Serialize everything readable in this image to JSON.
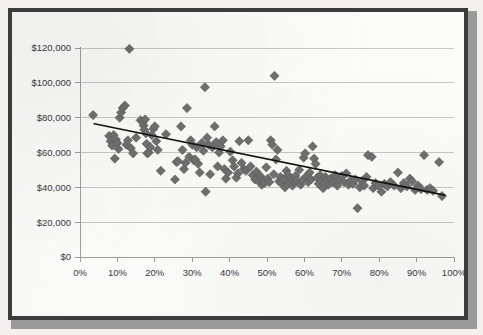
{
  "figure": {
    "frame_color": "#3c3c3c",
    "plot_background": "#fbfbfa",
    "marker_color": "#6f6f6f",
    "gridline_color": "#c6c6c6",
    "trendline_color": "#141414"
  },
  "chart_data": {
    "type": "scatter",
    "title": "",
    "subtitle": "",
    "xlabel": "",
    "ylabel": "",
    "xlim": [
      0,
      100
    ],
    "ylim": [
      0,
      120000
    ],
    "grid": true,
    "legend": "none",
    "x_tick_labels": [
      "0%",
      "10%",
      "20%",
      "30%",
      "40%",
      "50%",
      "60%",
      "70%",
      "80%",
      "90%",
      "100%"
    ],
    "x_tick_values": [
      0,
      10,
      20,
      30,
      40,
      50,
      60,
      70,
      80,
      90,
      100
    ],
    "y_tick_labels": [
      "$0",
      "$20,000",
      "$40,000",
      "$60,000",
      "$80,000",
      "$100,000",
      "$120,000"
    ],
    "y_tick_values": [
      0,
      20000,
      40000,
      60000,
      80000,
      100000,
      120000
    ],
    "series": [
      {
        "name": "observations",
        "marker": "diamond",
        "color": "#6f6f6f",
        "points": [
          [
            3.5,
            81500
          ],
          [
            7.8,
            69500
          ],
          [
            8.2,
            66500
          ],
          [
            8.6,
            64000
          ],
          [
            9.0,
            70000
          ],
          [
            9.3,
            56500
          ],
          [
            9.6,
            67500
          ],
          [
            10.0,
            65500
          ],
          [
            10.3,
            62000
          ],
          [
            10.6,
            80000
          ],
          [
            11.0,
            83000
          ],
          [
            11.4,
            85500
          ],
          [
            12.0,
            87000
          ],
          [
            12.4,
            64500
          ],
          [
            12.8,
            67000
          ],
          [
            13.2,
            119500
          ],
          [
            13.6,
            62500
          ],
          [
            14.2,
            59500
          ],
          [
            15.0,
            68500
          ],
          [
            16.2,
            78500
          ],
          [
            16.8,
            77500
          ],
          [
            17.0,
            75500
          ],
          [
            17.2,
            73000
          ],
          [
            17.4,
            79000
          ],
          [
            17.6,
            71000
          ],
          [
            17.8,
            65000
          ],
          [
            18.0,
            59500
          ],
          [
            18.4,
            60000
          ],
          [
            18.8,
            63000
          ],
          [
            19.2,
            70000
          ],
          [
            19.6,
            73500
          ],
          [
            20.0,
            75000
          ],
          [
            20.4,
            66500
          ],
          [
            20.8,
            61500
          ],
          [
            21.6,
            49500
          ],
          [
            23.0,
            70500
          ],
          [
            25.4,
            44500
          ],
          [
            25.8,
            54500
          ],
          [
            26.2,
            55000
          ],
          [
            27.0,
            75000
          ],
          [
            27.4,
            61500
          ],
          [
            27.8,
            50500
          ],
          [
            28.2,
            54000
          ],
          [
            28.6,
            85500
          ],
          [
            29.2,
            57500
          ],
          [
            29.6,
            67000
          ],
          [
            30.0,
            64500
          ],
          [
            30.4,
            55500
          ],
          [
            30.8,
            56000
          ],
          [
            31.2,
            63000
          ],
          [
            31.6,
            53500
          ],
          [
            32.0,
            48500
          ],
          [
            32.6,
            65500
          ],
          [
            33.0,
            61000
          ],
          [
            33.4,
            97500
          ],
          [
            33.6,
            37500
          ],
          [
            34.0,
            68500
          ],
          [
            34.4,
            64500
          ],
          [
            34.8,
            47500
          ],
          [
            35.4,
            63000
          ],
          [
            36.0,
            75000
          ],
          [
            36.4,
            66000
          ],
          [
            36.8,
            52000
          ],
          [
            37.2,
            60000
          ],
          [
            37.6,
            63500
          ],
          [
            38.2,
            67000
          ],
          [
            38.6,
            50500
          ],
          [
            39.0,
            45000
          ],
          [
            39.6,
            48500
          ],
          [
            40.2,
            60500
          ],
          [
            40.8,
            55500
          ],
          [
            41.2,
            52000
          ],
          [
            41.8,
            45500
          ],
          [
            42.2,
            48000
          ],
          [
            42.6,
            66500
          ],
          [
            43.2,
            54000
          ],
          [
            43.8,
            50500
          ],
          [
            44.4,
            49500
          ],
          [
            45.0,
            67000
          ],
          [
            45.6,
            52000
          ],
          [
            46.2,
            47000
          ],
          [
            46.8,
            44500
          ],
          [
            47.2,
            49000
          ],
          [
            47.8,
            43500
          ],
          [
            48.2,
            46500
          ],
          [
            48.6,
            41500
          ],
          [
            49.0,
            44000
          ],
          [
            49.4,
            42500
          ],
          [
            49.8,
            51500
          ],
          [
            50.2,
            45000
          ],
          [
            50.6,
            43000
          ],
          [
            51.0,
            67000
          ],
          [
            51.4,
            64500
          ],
          [
            51.8,
            47500
          ],
          [
            52.0,
            104000
          ],
          [
            52.4,
            56000
          ],
          [
            52.8,
            61500
          ],
          [
            53.2,
            43500
          ],
          [
            53.6,
            46000
          ],
          [
            54.0,
            42000
          ],
          [
            54.4,
            44500
          ],
          [
            54.8,
            40000
          ],
          [
            55.2,
            49500
          ],
          [
            55.6,
            47000
          ],
          [
            56.0,
            43000
          ],
          [
            56.4,
            45500
          ],
          [
            56.8,
            41000
          ],
          [
            57.2,
            43500
          ],
          [
            57.6,
            46500
          ],
          [
            58.0,
            44000
          ],
          [
            58.6,
            50000
          ],
          [
            59.0,
            41500
          ],
          [
            59.4,
            44000
          ],
          [
            59.8,
            57000
          ],
          [
            60.2,
            59500
          ],
          [
            60.6,
            46500
          ],
          [
            61.0,
            43000
          ],
          [
            61.4,
            48500
          ],
          [
            61.8,
            44500
          ],
          [
            62.2,
            63500
          ],
          [
            62.6,
            56500
          ],
          [
            63.0,
            53500
          ],
          [
            63.4,
            45500
          ],
          [
            63.8,
            42000
          ],
          [
            64.2,
            47000
          ],
          [
            64.6,
            44000
          ],
          [
            65.0,
            39500
          ],
          [
            65.6,
            46000
          ],
          [
            66.0,
            43500
          ],
          [
            66.4,
            41500
          ],
          [
            67.0,
            45000
          ],
          [
            67.6,
            43000
          ],
          [
            68.2,
            47000
          ],
          [
            68.8,
            41000
          ],
          [
            69.4,
            44500
          ],
          [
            70.0,
            46500
          ],
          [
            70.6,
            43000
          ],
          [
            71.2,
            48000
          ],
          [
            71.8,
            41500
          ],
          [
            72.4,
            44000
          ],
          [
            73.0,
            42000
          ],
          [
            73.6,
            44500
          ],
          [
            74.2,
            28000
          ],
          [
            74.8,
            40000
          ],
          [
            75.4,
            43500
          ],
          [
            76.0,
            41000
          ],
          [
            76.6,
            46000
          ],
          [
            77.0,
            58500
          ],
          [
            78.0,
            57500
          ],
          [
            78.4,
            39500
          ],
          [
            79.0,
            42500
          ],
          [
            79.8,
            41000
          ],
          [
            80.6,
            37500
          ],
          [
            81.4,
            42000
          ],
          [
            82.2,
            40500
          ],
          [
            83.0,
            43000
          ],
          [
            84.0,
            41000
          ],
          [
            85.0,
            48500
          ],
          [
            85.8,
            39500
          ],
          [
            86.6,
            42500
          ],
          [
            87.4,
            40500
          ],
          [
            88.2,
            45000
          ],
          [
            88.8,
            43500
          ],
          [
            89.6,
            38500
          ],
          [
            90.4,
            41000
          ],
          [
            91.2,
            39000
          ],
          [
            92.0,
            58500
          ],
          [
            92.8,
            38500
          ],
          [
            93.6,
            39500
          ],
          [
            94.4,
            38000
          ],
          [
            96.0,
            54500
          ],
          [
            96.8,
            35000
          ]
        ]
      }
    ],
    "trendline": {
      "type": "linear",
      "x_start": 3.8,
      "y_start": 76500,
      "x_end": 97.5,
      "y_end": 35500
    }
  }
}
